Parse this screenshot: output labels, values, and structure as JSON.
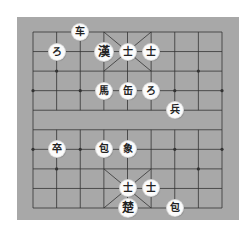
{
  "board": {
    "background": "#a8a8a8",
    "line_color": "#333333",
    "columns": 9,
    "rows": 10
  },
  "pieces": [
    {
      "label": "车",
      "col": 2,
      "row": 0,
      "side": "top",
      "type": "chariot"
    },
    {
      "label": "ろ",
      "col": 1,
      "row": 1,
      "side": "top",
      "type": "horse"
    },
    {
      "label": "漢",
      "col": 3,
      "row": 1,
      "side": "top",
      "type": "general"
    },
    {
      "label": "士",
      "col": 4,
      "row": 1,
      "side": "top",
      "type": "advisor"
    },
    {
      "label": "士",
      "col": 5,
      "row": 1,
      "side": "top",
      "type": "advisor"
    },
    {
      "label": "馬",
      "col": 3,
      "row": 3,
      "side": "top",
      "type": "horse"
    },
    {
      "label": "缶",
      "col": 4,
      "row": 3,
      "side": "top",
      "type": "cannon"
    },
    {
      "label": "ろ",
      "col": 5,
      "row": 3,
      "side": "top",
      "type": "horse"
    },
    {
      "label": "兵",
      "col": 6,
      "row": 4,
      "side": "bottom",
      "type": "soldier"
    },
    {
      "label": "卒",
      "col": 1,
      "row": 6,
      "side": "top",
      "type": "soldier"
    },
    {
      "label": "包",
      "col": 3,
      "row": 6,
      "side": "bottom",
      "type": "cannon"
    },
    {
      "label": "象",
      "col": 4,
      "row": 6,
      "side": "bottom",
      "type": "elephant"
    },
    {
      "label": "士",
      "col": 4,
      "row": 8,
      "side": "bottom",
      "type": "advisor"
    },
    {
      "label": "士",
      "col": 5,
      "row": 8,
      "side": "bottom",
      "type": "advisor"
    },
    {
      "label": "楚",
      "col": 4,
      "row": 9,
      "side": "bottom",
      "type": "general"
    },
    {
      "label": "包",
      "col": 6,
      "row": 9,
      "side": "bottom",
      "type": "cannon"
    }
  ]
}
